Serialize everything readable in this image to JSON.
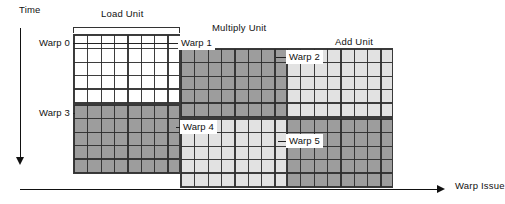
{
  "figure": {
    "type": "timeline-occupancy-diagram",
    "axes": {
      "y": {
        "label": "Time",
        "direction": "downward"
      },
      "x": {
        "label": "Warp Issue",
        "direction": "rightward"
      }
    },
    "cell": {
      "width_px": 13.35,
      "height_px": 17.6
    },
    "colors": {
      "white": "#ffffff",
      "light_gray": "#e2e2e2",
      "dark_gray": "#9d9d9d",
      "grid_line": "#2d2d2d",
      "axis": "#111111"
    }
  },
  "units": [
    {
      "id": "load",
      "label": "Load Unit",
      "columns": 8,
      "rows": 8,
      "bands": [
        {
          "warp": "Warp 0",
          "rows": 4,
          "shade": "white"
        },
        {
          "warp": "Warp 3",
          "rows": 4,
          "shade": "dark_gray"
        }
      ]
    },
    {
      "id": "multiply",
      "label": "Multiply Unit",
      "columns": 8,
      "rows": 8,
      "bands": [
        {
          "warp": "Warp 1",
          "rows": 4,
          "shade": "dark_gray"
        },
        {
          "warp": "Warp 4",
          "rows": 4,
          "shade": "light_gray"
        }
      ]
    },
    {
      "id": "add",
      "label": "Add Unit",
      "columns": 8,
      "rows": 8,
      "bands": [
        {
          "warp": "Warp 2",
          "rows": 4,
          "shade": "light_gray"
        },
        {
          "warp": "Warp 5",
          "rows": 4,
          "shade": "dark_gray"
        }
      ]
    }
  ],
  "warp_labels": [
    {
      "id": "warp0",
      "text": "Warp 0"
    },
    {
      "id": "warp1",
      "text": "Warp 1"
    },
    {
      "id": "warp2",
      "text": "Warp 2"
    },
    {
      "id": "warp3",
      "text": "Warp 3"
    },
    {
      "id": "warp4",
      "text": "Warp 4"
    },
    {
      "id": "warp5",
      "text": "Warp 5"
    }
  ]
}
